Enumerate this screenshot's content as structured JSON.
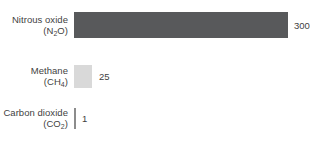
{
  "chart_data": {
    "type": "bar",
    "orientation": "horizontal",
    "title": "",
    "subtitle": "",
    "xlabel": "",
    "ylabel": "",
    "grid": false,
    "legend": null,
    "xlim": [
      0,
      300
    ],
    "categories": [
      "Nitrous oxide (N2O)",
      "Methane (CH4)",
      "Carbon dioxide (CO2)"
    ],
    "values": [
      300,
      25,
      1
    ],
    "value_labels": [
      "300",
      "25",
      "1"
    ],
    "bar_colors": [
      "#58595b",
      "#d9d9d9",
      "#8c8c8c"
    ],
    "bars": [
      {
        "name_line1": "Nitrous oxide",
        "name_line2_prefix": "(N",
        "name_line2_sub": "2",
        "name_line2_suffix": "O)",
        "value": 300,
        "value_label": "300",
        "color": "#58595b",
        "width_px": 214
      },
      {
        "name_line1": "Methane",
        "name_line2_prefix": "(CH",
        "name_line2_sub": "4",
        "name_line2_suffix": ")",
        "value": 25,
        "value_label": "25",
        "color": "#d9d9d9",
        "width_px": 18
      },
      {
        "name_line1": "Carbon dioxide",
        "name_line2_prefix": "(CO",
        "name_line2_sub": "2",
        "name_line2_suffix": ")",
        "value": 1,
        "value_label": "1",
        "color": "#8c8c8c",
        "width_px": 2
      }
    ]
  },
  "colors": {
    "background": "#ffffff",
    "text": "#3f3f3f",
    "bar_dark": "#58595b",
    "bar_light": "#d9d9d9",
    "bar_thin": "#8c8c8c"
  }
}
